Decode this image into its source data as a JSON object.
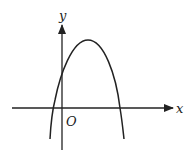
{
  "figure": {
    "type": "parabola-on-axes",
    "labels": {
      "x_axis": "x",
      "y_axis": "y",
      "origin": "O"
    },
    "colors": {
      "stroke": "#222222",
      "background": "#ffffff"
    },
    "geometry_px": {
      "origin": [
        62,
        108
      ],
      "x_axis": {
        "from": [
          12,
          108
        ],
        "to": [
          173,
          108
        ]
      },
      "y_axis": {
        "from": [
          62,
          150
        ],
        "to": [
          62,
          25
        ]
      },
      "parabola": {
        "vertex": [
          88,
          40
        ],
        "left_root": [
          53,
          108
        ],
        "right_root": [
          120,
          108
        ],
        "y_intercept": [
          62,
          72
        ],
        "left_end": [
          50,
          139
        ],
        "right_end": [
          124,
          139
        ]
      }
    }
  }
}
